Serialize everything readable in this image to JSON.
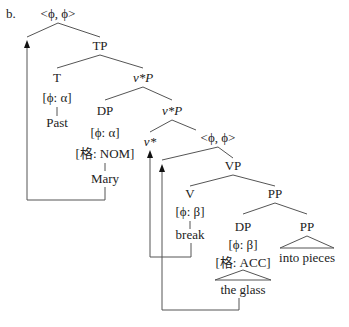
{
  "diagram": {
    "example_label": "b.",
    "type": "syntax-tree",
    "nodes": {
      "root": "<ϕ, ϕ>",
      "tp": "TP",
      "t": "T",
      "t_feature": "[ϕ: α]",
      "t_leaf": "Past",
      "vstarp_upper": "v*P",
      "dp_subj": "DP",
      "dp_subj_feature": "[ϕ: α]",
      "dp_subj_case": "[格: NOM]",
      "dp_subj_leaf": "Mary",
      "vstarp_lower": "v*P",
      "vstar": "v*",
      "inner_pair": "<ϕ, ϕ>",
      "vp": "VP",
      "v": "V",
      "v_feature": "[ϕ: β]",
      "v_leaf": "break",
      "pp_upper": "PP",
      "dp_obj": "DP",
      "dp_obj_feature": "[ϕ: β]",
      "dp_obj_case": "[格: ACC]",
      "dp_obj_leaf": "the glass",
      "pp_lower": "PP",
      "pp_lower_leaf": "into pieces"
    },
    "movements": [
      {
        "from": "Mary",
        "to": "root <ϕ, ϕ> (left daughter)"
      },
      {
        "from": "break",
        "to": "v*"
      },
      {
        "from": "the glass",
        "to": "inner <ϕ, ϕ> (left daughter)"
      }
    ]
  }
}
